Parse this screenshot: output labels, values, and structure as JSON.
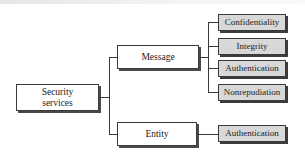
{
  "diagram": {
    "root": {
      "label_line1": "Security",
      "label_line2": "services"
    },
    "branches": [
      {
        "label": "Message",
        "children": [
          "Confidentiality",
          "Integrity",
          "Authentication",
          "Nonrepudiation"
        ]
      },
      {
        "label": "Entity",
        "children": [
          "Authentication"
        ]
      }
    ],
    "colors": {
      "line": "#3a3a3a",
      "leaf_fill": "#d8d8d8",
      "node_fill": "#ffffff",
      "shadow": "#3c3c3c"
    }
  }
}
